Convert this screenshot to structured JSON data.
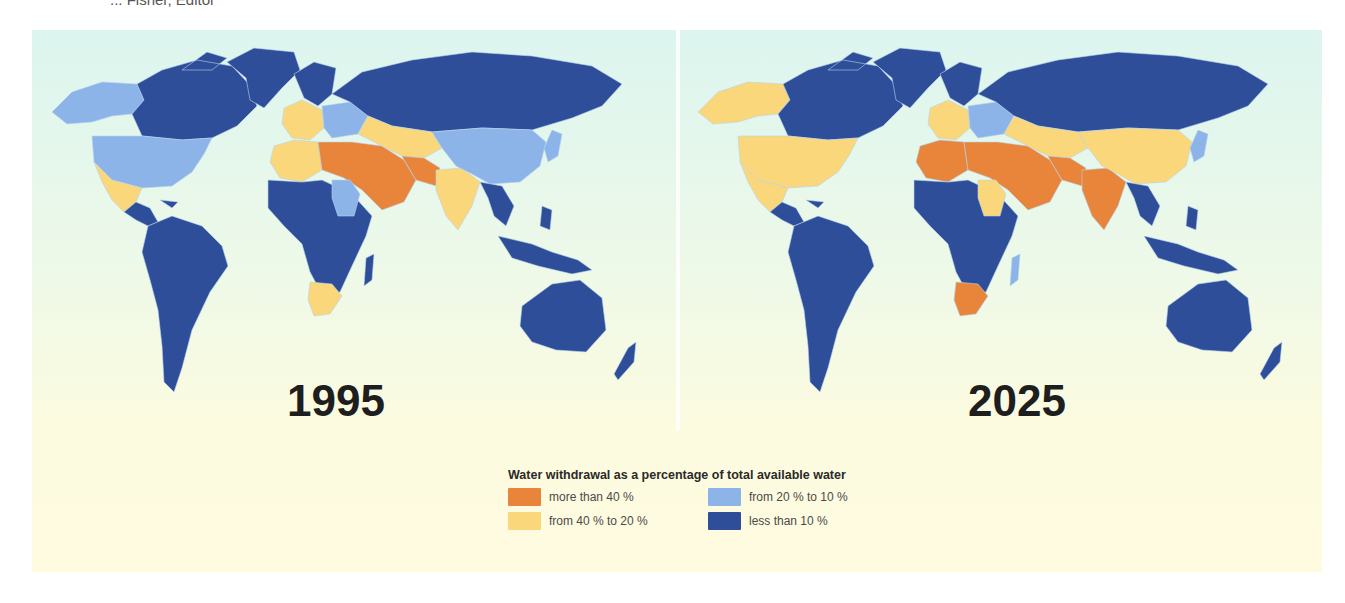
{
  "caption": "... Fisher, Editor",
  "figure": {
    "legend": {
      "title": "Water withdrawal as a percentage of total available water",
      "items": [
        {
          "key": "gt40",
          "label": "more than 40 %",
          "color": "#e8853a"
        },
        {
          "key": "20to10",
          "label": "from 20 % to 10 %",
          "color": "#8cb4e8"
        },
        {
          "key": "40to20",
          "label": "from 40 % to 20 %",
          "color": "#f9d77a"
        },
        {
          "key": "lt10",
          "label": "less than 10 %",
          "color": "#2e4e9a"
        }
      ]
    },
    "maps": [
      {
        "year": "1995"
      },
      {
        "year": "2025"
      }
    ]
  },
  "chart_data": {
    "type": "choropleth-map",
    "title": "Water withdrawal as a percentage of total available water",
    "categories": [
      "more than 40 %",
      "from 40 % to 20 %",
      "from 20 % to 10 %",
      "less than 10 %"
    ],
    "colors": {
      "more than 40 %": "#e8853a",
      "from 40 % to 20 %": "#f9d77a",
      "from 20 % to 10 %": "#8cb4e8",
      "less than 10 %": "#2e4e9a"
    },
    "maps": [
      {
        "year": "1995",
        "regions": {
          "Alaska": "from 20 % to 10 %",
          "Canada": "less than 10 %",
          "Greenland": "less than 10 %",
          "United States": "from 20 % to 10 %",
          "Mexico": "from 40 % to 20 %",
          "Central America & Caribbean": "less than 10 %",
          "South America": "less than 10 %",
          "Northern Europe": "less than 10 %",
          "Western Europe": "from 40 % to 20 %",
          "Eastern Europe": "from 20 % to 10 %",
          "Russia": "less than 10 %",
          "North Africa (west)": "from 40 % to 20 %",
          "North Africa & Middle East": "more than 40 %",
          "Central Asia": "from 40 % to 20 %",
          "Pakistan/Iran": "more than 40 %",
          "India": "from 40 % to 20 %",
          "China": "from 20 % to 10 %",
          "Japan/Korea": "from 20 % to 10 %",
          "Southeast Asia": "less than 10 %",
          "Sub-Saharan Africa": "less than 10 %",
          "Sudan/Sahel": "from 20 % to 10 %",
          "Southern Africa": "from 40 % to 20 %",
          "Madagascar": "less than 10 %",
          "Indonesia/Philippines": "less than 10 %",
          "Australia": "less than 10 %",
          "New Zealand": "less than 10 %"
        }
      },
      {
        "year": "2025",
        "regions": {
          "Alaska": "from 40 % to 20 %",
          "Canada": "less than 10 %",
          "Greenland": "less than 10 %",
          "United States": "from 40 % to 20 %",
          "Mexico": "from 40 % to 20 %",
          "Central America & Caribbean": "less than 10 %",
          "South America": "less than 10 %",
          "Northern Europe": "less than 10 %",
          "Western Europe": "from 40 % to 20 %",
          "Eastern Europe": "from 20 % to 10 %",
          "Russia": "less than 10 %",
          "North Africa (west)": "more than 40 %",
          "North Africa & Middle East": "more than 40 %",
          "Central Asia": "from 40 % to 20 %",
          "Pakistan/Iran": "more than 40 %",
          "India": "more than 40 %",
          "China": "from 40 % to 20 %",
          "Japan/Korea": "from 20 % to 10 %",
          "Southeast Asia": "less than 10 %",
          "Sub-Saharan Africa": "less than 10 %",
          "Sudan/Sahel": "from 40 % to 20 %",
          "Southern Africa": "more than 40 %",
          "Madagascar": "from 20 % to 10 %",
          "Indonesia/Philippines": "less than 10 %",
          "Australia": "less than 10 %",
          "New Zealand": "less than 10 %"
        }
      }
    ]
  }
}
